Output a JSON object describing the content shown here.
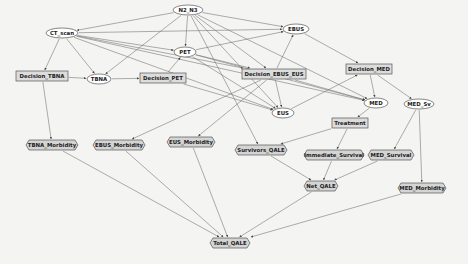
{
  "diagram": {
    "type": "influence-diagram",
    "colors": {
      "background": "#f4f4f2",
      "chance_fill": "#ffffff",
      "decision_fill": "#dcdcdc",
      "utility_fill": "#d4d4d4",
      "stroke": "#555555",
      "edge": "#777777"
    },
    "nodes": [
      {
        "id": "N2_N3",
        "label": "N2_N3",
        "kind": "chance",
        "x": 188,
        "y": 10,
        "w": 30,
        "h": 10
      },
      {
        "id": "CT_scan",
        "label": "CT_scan",
        "kind": "chance",
        "x": 62,
        "y": 33,
        "w": 32,
        "h": 10
      },
      {
        "id": "EBUS",
        "label": "EBUS",
        "kind": "chance",
        "x": 296,
        "y": 29,
        "w": 26,
        "h": 10
      },
      {
        "id": "PET",
        "label": "PET",
        "kind": "chance",
        "x": 185,
        "y": 52,
        "w": 22,
        "h": 10
      },
      {
        "id": "Decision_TBNA",
        "label": "Decision_TBNA",
        "kind": "decision",
        "x": 42,
        "y": 76,
        "w": 52,
        "h": 10
      },
      {
        "id": "TBNA",
        "label": "TBNA",
        "kind": "chance",
        "x": 99,
        "y": 79,
        "w": 24,
        "h": 10
      },
      {
        "id": "Decision_PET",
        "label": "Decision_PET",
        "kind": "decision",
        "x": 163,
        "y": 78,
        "w": 46,
        "h": 10
      },
      {
        "id": "Decision_EBUS_EUS",
        "label": "Decision_EBUS_EUS",
        "kind": "decision",
        "x": 274,
        "y": 74,
        "w": 64,
        "h": 10
      },
      {
        "id": "Decision_MED",
        "label": "Decision_MED",
        "kind": "decision",
        "x": 369,
        "y": 69,
        "w": 46,
        "h": 10
      },
      {
        "id": "MED",
        "label": "MED",
        "kind": "chance",
        "x": 376,
        "y": 103,
        "w": 24,
        "h": 10
      },
      {
        "id": "MED_Sv",
        "label": "MED_Sv",
        "kind": "chance",
        "x": 419,
        "y": 104,
        "w": 30,
        "h": 10
      },
      {
        "id": "EUS",
        "label": "EUS",
        "kind": "chance",
        "x": 283,
        "y": 113,
        "w": 22,
        "h": 10
      },
      {
        "id": "Treatment",
        "label": "Treatment",
        "kind": "decision",
        "x": 350,
        "y": 123,
        "w": 36,
        "h": 10
      },
      {
        "id": "TBNA_Morbidity",
        "label": "TBNA_Morbidity",
        "kind": "utility",
        "x": 52,
        "y": 145,
        "w": 52,
        "h": 10
      },
      {
        "id": "EBUS_Morbidity",
        "label": "EBUS_Morbidity",
        "kind": "utility",
        "x": 119,
        "y": 145,
        "w": 52,
        "h": 10
      },
      {
        "id": "EUS_Morbidity",
        "label": "EUS_Morbidity",
        "kind": "utility",
        "x": 191,
        "y": 142,
        "w": 48,
        "h": 10
      },
      {
        "id": "Survivors_QALE",
        "label": "Survivors_QALE",
        "kind": "utility",
        "x": 261,
        "y": 150,
        "w": 52,
        "h": 10
      },
      {
        "id": "Immediate_Survival",
        "label": "Immediate_Survival",
        "kind": "utility",
        "x": 334,
        "y": 155,
        "w": 60,
        "h": 10
      },
      {
        "id": "MED_Survival",
        "label": "MED_Survival",
        "kind": "utility",
        "x": 391,
        "y": 155,
        "w": 46,
        "h": 10
      },
      {
        "id": "Net_QALE",
        "label": "Net_QALE",
        "kind": "utility",
        "x": 321,
        "y": 186,
        "w": 34,
        "h": 10
      },
      {
        "id": "MED_Morbidity",
        "label": "MED_Morbidity",
        "kind": "utility",
        "x": 422,
        "y": 188,
        "w": 48,
        "h": 10
      },
      {
        "id": "Total_QALE",
        "label": "Total_QALE",
        "kind": "utility",
        "x": 230,
        "y": 243,
        "w": 40,
        "h": 10
      }
    ],
    "edges": [
      [
        "N2_N3",
        "CT_scan"
      ],
      [
        "N2_N3",
        "EBUS"
      ],
      [
        "N2_N3",
        "PET"
      ],
      [
        "N2_N3",
        "TBNA"
      ],
      [
        "N2_N3",
        "EUS"
      ],
      [
        "N2_N3",
        "MED"
      ],
      [
        "N2_N3",
        "Survivors_QALE"
      ],
      [
        "N2_N3",
        "Decision_EBUS_EUS"
      ],
      [
        "CT_scan",
        "EBUS"
      ],
      [
        "CT_scan",
        "PET"
      ],
      [
        "CT_scan",
        "Decision_TBNA"
      ],
      [
        "CT_scan",
        "TBNA"
      ],
      [
        "CT_scan",
        "Decision_EBUS_EUS"
      ],
      [
        "CT_scan",
        "EUS"
      ],
      [
        "CT_scan",
        "MED"
      ],
      [
        "PET",
        "EBUS"
      ],
      [
        "PET",
        "Decision_EBUS_EUS"
      ],
      [
        "PET",
        "EUS"
      ],
      [
        "PET",
        "MED"
      ],
      [
        "Decision_TBNA",
        "TBNA"
      ],
      [
        "Decision_TBNA",
        "TBNA_Morbidity"
      ],
      [
        "TBNA",
        "Decision_PET"
      ],
      [
        "Decision_PET",
        "PET"
      ],
      [
        "Decision_PET",
        "EUS"
      ],
      [
        "Decision_EBUS_EUS",
        "EBUS"
      ],
      [
        "Decision_EBUS_EUS",
        "EUS"
      ],
      [
        "Decision_EBUS_EUS",
        "MED"
      ],
      [
        "Decision_EBUS_EUS",
        "EBUS_Morbidity"
      ],
      [
        "Decision_EBUS_EUS",
        "EUS_Morbidity"
      ],
      [
        "EBUS",
        "Decision_MED"
      ],
      [
        "EUS",
        "Decision_MED"
      ],
      [
        "Decision_MED",
        "MED"
      ],
      [
        "Decision_MED",
        "MED_Sv"
      ],
      [
        "MED",
        "Treatment"
      ],
      [
        "MED_Sv",
        "MED_Survival"
      ],
      [
        "MED_Sv",
        "MED_Morbidity"
      ],
      [
        "Treatment",
        "Survivors_QALE"
      ],
      [
        "Treatment",
        "Immediate_Survival"
      ],
      [
        "Survivors_QALE",
        "Net_QALE"
      ],
      [
        "Immediate_Survival",
        "Net_QALE"
      ],
      [
        "MED_Survival",
        "Net_QALE"
      ],
      [
        "TBNA_Morbidity",
        "Total_QALE"
      ],
      [
        "EBUS_Morbidity",
        "Total_QALE"
      ],
      [
        "EUS_Morbidity",
        "Total_QALE"
      ],
      [
        "Net_QALE",
        "Total_QALE"
      ],
      [
        "MED_Morbidity",
        "Total_QALE"
      ]
    ]
  }
}
